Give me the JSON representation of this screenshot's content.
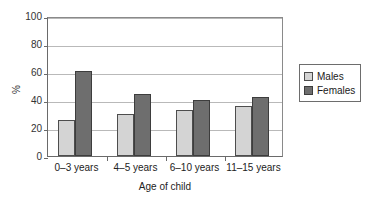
{
  "chart_data": {
    "type": "bar",
    "title": "",
    "xlabel": "Age of child",
    "ylabel": "%",
    "categories": [
      "0–3 years",
      "4–5 years",
      "6–10 years",
      "11–15 years"
    ],
    "series": [
      {
        "name": "Males",
        "values": [
          26,
          30,
          33,
          36
        ],
        "color": "#d4d4d4"
      },
      {
        "name": "Females",
        "values": [
          61,
          44,
          40,
          42
        ],
        "color": "#6e6e6e"
      }
    ],
    "ylim": [
      0,
      100
    ],
    "yticks": [
      0,
      20,
      40,
      60,
      80,
      100
    ],
    "ytick_labels": [
      "0",
      "20",
      "40",
      "60",
      "80",
      "100"
    ],
    "grid": true,
    "legend_position": "right"
  },
  "legend": {
    "entries": [
      {
        "label": "Males"
      },
      {
        "label": "Females"
      }
    ]
  },
  "axes": {
    "y_title": "%",
    "x_title": "Age of child"
  }
}
